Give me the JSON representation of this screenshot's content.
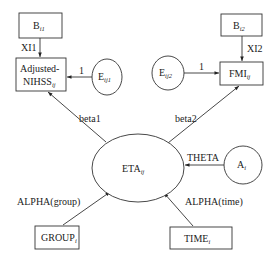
{
  "diagram": {
    "type": "path-diagram",
    "colors": {
      "stroke": "#333333",
      "background": "#ffffff",
      "text": "#222222"
    },
    "nodes": {
      "b_i1": {
        "shape": "rect",
        "label": "B",
        "sub": "i1"
      },
      "adjusted_nihss": {
        "shape": "rect",
        "label_line1": "Adjusted-",
        "label_line2": "NIHSS",
        "sub": "ij"
      },
      "e_ij1": {
        "shape": "ellipse",
        "label": "E",
        "sub": "ij1"
      },
      "b_i2": {
        "shape": "rect",
        "label": "B",
        "sub": "i2"
      },
      "e_ij2": {
        "shape": "ellipse",
        "label": "E",
        "sub": "ij2"
      },
      "fmi": {
        "shape": "rect",
        "label": "FMI",
        "sub": "ij"
      },
      "eta": {
        "shape": "ellipse",
        "label": "ETA",
        "sub": "ij"
      },
      "a_i": {
        "shape": "ellipse",
        "label": "A",
        "sub": "i"
      },
      "group": {
        "shape": "rect",
        "label": "GROUP",
        "sub": "i"
      },
      "time": {
        "shape": "rect",
        "label": "TIME",
        "sub": "i"
      }
    },
    "edges": {
      "xi1": {
        "from": "B_i1",
        "to": "Adjusted-NIHSS_ij",
        "label": "XI1"
      },
      "e1": {
        "from": "E_ij1",
        "to": "Adjusted-NIHSS_ij",
        "label": "1"
      },
      "xi2": {
        "from": "B_i2",
        "to": "FMI_ij",
        "label": "XI2"
      },
      "e2": {
        "from": "E_ij2",
        "to": "FMI_ij",
        "label": "1"
      },
      "beta1": {
        "from": "ETA_ij",
        "to": "Adjusted-NIHSS_ij",
        "label": "beta1"
      },
      "beta2": {
        "from": "ETA_ij",
        "to": "FMI_ij",
        "label": "beta2"
      },
      "theta": {
        "from": "A_i",
        "to": "ETA_ij",
        "label": "THETA"
      },
      "alpha_group": {
        "from": "GROUP_i",
        "to": "ETA_ij",
        "label": "ALPHA(group)"
      },
      "alpha_time": {
        "from": "TIME_i",
        "to": "ETA_ij",
        "label": "ALPHA(time)"
      }
    }
  }
}
